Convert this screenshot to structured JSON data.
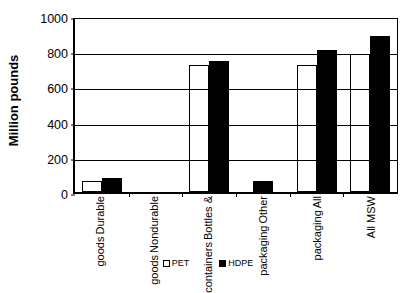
{
  "chart_data": {
    "type": "bar",
    "title": "",
    "xlabel": "",
    "ylabel": "Million pounds",
    "ylim": [
      0,
      1000
    ],
    "yticks": [
      0,
      200,
      400,
      600,
      800,
      1000
    ],
    "grid": true,
    "legend_position": "bottom",
    "categories": [
      "Durable goods",
      "Nondurable goods",
      "Bottles & containers",
      "Other packaging",
      "All packaging",
      "All MSW"
    ],
    "category_lines": [
      [
        "Durable",
        "goods"
      ],
      [
        "Nondurable",
        "goods"
      ],
      [
        "Bottles &",
        "containers"
      ],
      [
        "Other",
        "packaging"
      ],
      [
        "All",
        "packaging"
      ],
      [
        "All MSW"
      ]
    ],
    "series": [
      {
        "name": "PET",
        "color": "#ffffff",
        "edge_color": "#000000",
        "values": [
          60,
          0,
          722,
          0,
          723,
          785
        ]
      },
      {
        "name": "HDPE",
        "color": "#000000",
        "edge_color": "#000000",
        "values": [
          82,
          0,
          745,
          63,
          805,
          885
        ]
      }
    ]
  },
  "axis": {
    "y_title": "Million pounds",
    "y_tick_labels": [
      "1000",
      "800",
      "600",
      "400",
      "200",
      "0"
    ]
  },
  "legend": {
    "items": [
      {
        "label": "PET",
        "swatch": "open-square"
      },
      {
        "label": "HDPE",
        "swatch": "filled-square"
      }
    ]
  }
}
